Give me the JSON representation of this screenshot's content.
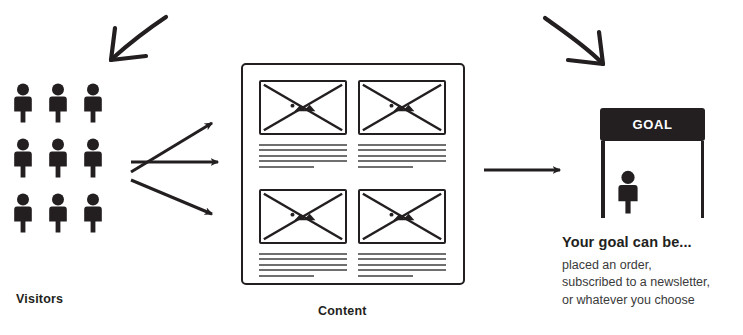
{
  "diagram": {
    "colors": {
      "ink": "#231f20",
      "line_gray": "#6f6f6f",
      "background": "#ffffff",
      "banner_bg": "#231f20",
      "banner_text": "#ffffff"
    }
  },
  "visitors": {
    "caption": "Visitors",
    "icon": "person-icon",
    "rows": 3,
    "columns": 3,
    "count": 9,
    "people": [
      {
        "id": "person-1",
        "row": 1,
        "col": 1
      },
      {
        "id": "person-2",
        "row": 1,
        "col": 2
      },
      {
        "id": "person-3",
        "row": 1,
        "col": 3
      },
      {
        "id": "person-4",
        "row": 2,
        "col": 1
      },
      {
        "id": "person-5",
        "row": 2,
        "col": 2
      },
      {
        "id": "person-6",
        "row": 2,
        "col": 3
      },
      {
        "id": "person-7",
        "row": 3,
        "col": 1
      },
      {
        "id": "person-8",
        "row": 3,
        "col": 2
      },
      {
        "id": "person-9",
        "row": 3,
        "col": 3
      }
    ]
  },
  "content": {
    "caption": "Content",
    "cards": [
      {
        "id": "card-1",
        "thumbnail": "image-placeholder-icon",
        "text_lines": 5
      },
      {
        "id": "card-2",
        "thumbnail": "image-placeholder-icon",
        "text_lines": 5
      },
      {
        "id": "card-3",
        "thumbnail": "image-placeholder-icon",
        "text_lines": 5
      },
      {
        "id": "card-4",
        "thumbnail": "image-placeholder-icon",
        "text_lines": 5
      }
    ]
  },
  "goal": {
    "banner_label": "GOAL",
    "icon": "person-icon",
    "heading": "Your goal can be...",
    "examples": [
      "placed an order,",
      "subscribed to a newsletter,",
      "or whatever you choose"
    ]
  },
  "arrows": {
    "sketch_left": "hand-drawn-arrow-down-left-icon",
    "sketch_right": "hand-drawn-arrow-down-right-icon",
    "fan": [
      {
        "id": "arrow-up-right",
        "direction": "up-right"
      },
      {
        "id": "arrow-right",
        "direction": "right"
      },
      {
        "id": "arrow-down-right",
        "direction": "down-right"
      }
    ],
    "to_goal": {
      "id": "arrow-content-to-goal",
      "direction": "right"
    }
  }
}
